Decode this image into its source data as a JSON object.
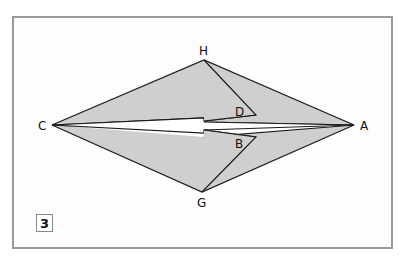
{
  "diagram": {
    "type": "origami-fold-step",
    "step_number": "3",
    "colors": {
      "paper_fill": "#cfcfcf",
      "outline": "#1a1a1a",
      "frame_border": "#9a9a9a",
      "background": "#ffffff"
    },
    "points": {
      "H": {
        "label": "H",
        "x": 204,
        "y": 60
      },
      "C": {
        "label": "C",
        "x": 52,
        "y": 125
      },
      "A": {
        "label": "A",
        "x": 354,
        "y": 125
      },
      "G": {
        "label": "G",
        "x": 202,
        "y": 192
      },
      "D": {
        "label": "D",
        "x": 256,
        "y": 115
      },
      "B": {
        "label": "B",
        "x": 256,
        "y": 137
      }
    },
    "labels": {
      "H": "H",
      "C": "C",
      "A": "A",
      "G": "G",
      "D": "D",
      "B": "B"
    }
  }
}
